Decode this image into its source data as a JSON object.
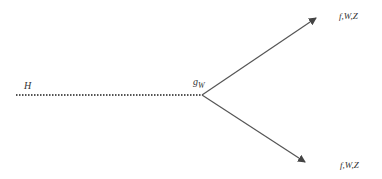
{
  "diagram": {
    "type": "feynman-vertex",
    "colors": {
      "line": "#555555",
      "text": "#333333",
      "background": "#ffffff"
    },
    "nodes": {
      "higgs_label": "H",
      "vertex_label_main": "g",
      "vertex_label_sub": "W",
      "upper_out_label": "f,W,Z",
      "lower_out_label": "f,W,Z"
    },
    "edges": [
      {
        "id": "higgs-line",
        "style": "dotted",
        "from": [
          16,
          95
        ],
        "to": [
          202,
          95
        ]
      },
      {
        "id": "upper-arrow",
        "style": "solid-arrow",
        "from": [
          202,
          95
        ],
        "to": [
          318,
          17
        ]
      },
      {
        "id": "lower-arrow",
        "style": "solid-arrow",
        "from": [
          202,
          95
        ],
        "to": [
          307,
          163
        ]
      }
    ]
  }
}
